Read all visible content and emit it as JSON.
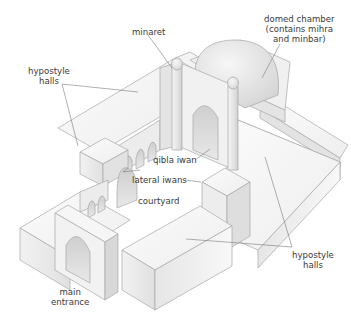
{
  "diagram": {
    "type": "isometric architectural diagram",
    "labels": {
      "minaret": "minaret",
      "domed_chamber": [
        "domed chamber",
        "(contains mihra",
        "and minbar)"
      ],
      "hypostyle_halls_top": [
        "hypostyle",
        "halls"
      ],
      "qibla_iwan": "qibla iwan",
      "lateral_iwans": "lateral iwans",
      "courtyard": "courtyard",
      "hypostyle_halls_bottom": [
        "hypostyle",
        "halls"
      ],
      "main_entrance": [
        "main",
        "entrance"
      ]
    },
    "colors": {
      "background": "#ffffff",
      "wall_light": "#f7f7f7",
      "wall_mid": "#e6e6e6",
      "wall_dark": "#d2d2d2",
      "outline": "#a8a8a8",
      "leader_line": "#7a7a7a",
      "text": "#3a3a3a"
    }
  }
}
